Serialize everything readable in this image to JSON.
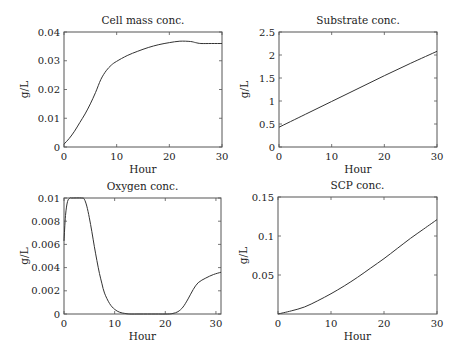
{
  "chart_data": [
    {
      "type": "line",
      "title": "Cell mass conc.",
      "xlabel": "Hour",
      "ylabel": "g/L",
      "xlim": [
        0,
        30
      ],
      "ylim": [
        0,
        0.04
      ],
      "xticks": [
        0,
        10,
        20,
        30
      ],
      "xtick_labels": [
        "0",
        "10",
        "20",
        "30"
      ],
      "yticks": [
        0,
        0.01,
        0.02,
        0.03,
        0.04
      ],
      "ytick_labels": [
        "0",
        "0.01",
        "0.02",
        "0.03",
        "0.04"
      ],
      "grid": false,
      "series": [
        {
          "name": "Cell mass",
          "x": [
            0,
            1,
            2,
            3,
            4,
            5,
            6,
            7,
            8,
            9,
            10,
            12,
            14,
            16,
            18,
            20,
            22,
            24,
            25,
            26,
            28,
            30
          ],
          "y": [
            0.001,
            0.003,
            0.0055,
            0.0085,
            0.0115,
            0.015,
            0.019,
            0.0235,
            0.0265,
            0.0285,
            0.0298,
            0.0318,
            0.0333,
            0.0346,
            0.0356,
            0.0363,
            0.0368,
            0.0367,
            0.0363,
            0.036,
            0.036,
            0.036
          ]
        }
      ]
    },
    {
      "type": "line",
      "title": "Substrate conc.",
      "xlabel": "Hour",
      "ylabel": "g/L",
      "xlim": [
        0,
        30
      ],
      "ylim": [
        0,
        2.5
      ],
      "xticks": [
        0,
        10,
        20,
        30
      ],
      "xtick_labels": [
        "0",
        "10",
        "20",
        "30"
      ],
      "yticks": [
        0,
        0.5,
        1,
        1.5,
        2,
        2.5
      ],
      "ytick_labels": [
        "0",
        "0.5",
        "1",
        "1.5",
        "2",
        "2.5"
      ],
      "grid": false,
      "series": [
        {
          "name": "Substrate",
          "x": [
            0,
            5,
            10,
            15,
            20,
            25,
            30
          ],
          "y": [
            0.43,
            0.71,
            0.99,
            1.27,
            1.55,
            1.82,
            2.08
          ]
        }
      ]
    },
    {
      "type": "line",
      "title": "Oxygen conc.",
      "xlabel": "Hour",
      "ylabel": "g/L",
      "xlim": [
        0,
        31
      ],
      "ylim": [
        0,
        0.01
      ],
      "xticks": [
        0,
        10,
        20,
        30
      ],
      "xtick_labels": [
        "0",
        "10",
        "20",
        "30"
      ],
      "yticks": [
        0,
        0.002,
        0.004,
        0.006,
        0.008,
        0.01
      ],
      "ytick_labels": [
        "0",
        "0.002",
        "0.004",
        "0.006",
        "0.008",
        "0.01"
      ],
      "grid": false,
      "series": [
        {
          "name": "Oxygen",
          "x": [
            0,
            0.3,
            0.7,
            1.2,
            1.5,
            3.5,
            4,
            4.5,
            5,
            5.5,
            6,
            6.5,
            7,
            7.5,
            8,
            9,
            10,
            11,
            12,
            13,
            15,
            18,
            20.5,
            21.5,
            22.5,
            23.5,
            24.5,
            25.5,
            26.5,
            28,
            29.5,
            31
          ],
          "y": [
            0.0063,
            0.0085,
            0.0097,
            0.01,
            0.01,
            0.01,
            0.0099,
            0.0093,
            0.0083,
            0.0071,
            0.0058,
            0.0046,
            0.0035,
            0.0026,
            0.0018,
            0.0009,
            0.0004,
            0.00015,
            5e-05,
            0,
            0,
            0,
            0,
            5e-05,
            0.0002,
            0.0006,
            0.0013,
            0.0021,
            0.0027,
            0.0031,
            0.0034,
            0.0036
          ]
        }
      ]
    },
    {
      "type": "line",
      "title": "SCP conc.",
      "xlabel": "Hour",
      "ylabel": "g/L",
      "xlim": [
        0,
        30
      ],
      "ylim": [
        0,
        0.15
      ],
      "xticks": [
        0,
        10,
        20,
        30
      ],
      "xtick_labels": [
        "0",
        "10",
        "20",
        "30"
      ],
      "yticks": [
        0.05,
        0.1,
        0.15
      ],
      "ytick_labels": [
        "0.05",
        "0.1",
        "0.15"
      ],
      "grid": false,
      "series": [
        {
          "name": "SCP",
          "x": [
            0,
            2.5,
            5,
            7.5,
            10,
            12.5,
            15,
            17.5,
            20,
            22.5,
            25,
            27.5,
            30
          ],
          "y": [
            0,
            0.004,
            0.009,
            0.017,
            0.026,
            0.036,
            0.047,
            0.059,
            0.071,
            0.084,
            0.097,
            0.109,
            0.121
          ]
        }
      ]
    }
  ]
}
